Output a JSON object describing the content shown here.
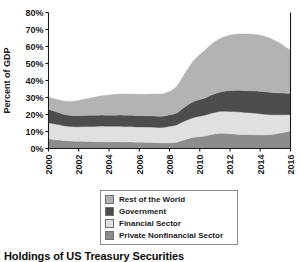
{
  "figure": {
    "title": "Holdings of US Treasury Securities"
  },
  "legend": {
    "items": [
      {
        "label": "Rest of the World",
        "color": "#b3b3b3"
      },
      {
        "label": "Government",
        "color": "#4d4d4d"
      },
      {
        "label": "Financial Sector",
        "color": "#e0e0e0"
      },
      {
        "label": "Private Nonfinancial Sector",
        "color": "#8c8c8c"
      }
    ]
  },
  "chart_data": {
    "type": "area",
    "stacked": true,
    "title": "Holdings of US Treasury Securities",
    "xlabel": "",
    "ylabel": "Percent of GDP",
    "xlim": [
      2000,
      2016
    ],
    "ylim": [
      0,
      80
    ],
    "ytick_labels": [
      "0%",
      "10%",
      "20%",
      "30%",
      "40%",
      "50%",
      "60%",
      "70%",
      "80%"
    ],
    "ytick_values": [
      0,
      10,
      20,
      30,
      40,
      50,
      60,
      70,
      80
    ],
    "xtick_labels": [
      "2000",
      "2002",
      "2004",
      "2006",
      "2008",
      "2010",
      "2012",
      "2014",
      "2016"
    ],
    "xtick_values": [
      2000,
      2002,
      2004,
      2006,
      2008,
      2010,
      2012,
      2014,
      2016
    ],
    "grid": false,
    "legend_position": "below-axes",
    "x": [
      2000.0,
      2000.25,
      2000.5,
      2000.75,
      2001.0,
      2001.25,
      2001.5,
      2001.75,
      2002.0,
      2002.25,
      2002.5,
      2002.75,
      2003.0,
      2003.25,
      2003.5,
      2003.75,
      2004.0,
      2004.25,
      2004.5,
      2004.75,
      2005.0,
      2005.25,
      2005.5,
      2005.75,
      2006.0,
      2006.25,
      2006.5,
      2006.75,
      2007.0,
      2007.25,
      2007.5,
      2007.75,
      2008.0,
      2008.25,
      2008.5,
      2008.75,
      2009.0,
      2009.25,
      2009.5,
      2009.75,
      2010.0,
      2010.25,
      2010.5,
      2010.75,
      2011.0,
      2011.25,
      2011.5,
      2011.75,
      2012.0,
      2012.25,
      2012.5,
      2012.75,
      2013.0,
      2013.25,
      2013.5,
      2013.75,
      2014.0,
      2014.25,
      2014.5,
      2014.75,
      2015.0,
      2015.25,
      2015.5,
      2015.75,
      2016.0
    ],
    "series": [
      {
        "name": "Private Nonfinancial Sector",
        "color": "#8c8c8c",
        "stack_order": 1,
        "values": [
          5.6,
          5.4,
          5.2,
          5.0,
          4.7,
          4.5,
          4.4,
          4.3,
          4.2,
          4.2,
          4.1,
          4.1,
          4.0,
          4.0,
          4.0,
          3.9,
          3.9,
          3.9,
          3.9,
          3.9,
          3.8,
          3.8,
          3.8,
          3.7,
          3.7,
          3.7,
          3.6,
          3.6,
          3.5,
          3.4,
          3.3,
          3.2,
          3.3,
          3.4,
          3.7,
          4.5,
          5.2,
          5.8,
          6.4,
          6.8,
          7.0,
          7.2,
          7.6,
          8.2,
          8.6,
          8.9,
          9.0,
          8.9,
          8.7,
          8.5,
          8.4,
          8.3,
          8.2,
          8.2,
          8.1,
          8.1,
          8.0,
          8.0,
          8.1,
          8.3,
          8.6,
          9.0,
          9.4,
          9.9,
          10.3
        ]
      },
      {
        "name": "Financial Sector",
        "color": "#e0e0e0",
        "stack_order": 2,
        "values": [
          9.5,
          9.3,
          9.1,
          8.9,
          8.7,
          8.6,
          8.5,
          8.5,
          8.6,
          8.7,
          8.8,
          8.9,
          9.0,
          9.1,
          9.2,
          9.2,
          9.2,
          9.2,
          9.2,
          9.2,
          9.1,
          9.1,
          9.1,
          9.0,
          9.0,
          9.0,
          9.0,
          9.0,
          9.0,
          9.0,
          9.1,
          9.4,
          9.8,
          10.0,
          10.2,
          10.6,
          11.0,
          11.3,
          11.5,
          11.8,
          12.0,
          12.2,
          12.4,
          12.5,
          12.6,
          12.8,
          12.9,
          13.0,
          13.1,
          13.2,
          13.2,
          13.1,
          13.0,
          12.9,
          12.8,
          12.6,
          12.4,
          12.2,
          11.9,
          11.5,
          11.2,
          10.8,
          10.4,
          10.0,
          9.6
        ]
      },
      {
        "name": "Government",
        "color": "#4d4d4d",
        "stack_order": 3,
        "values": [
          7.9,
          7.6,
          7.3,
          7.0,
          6.7,
          6.6,
          6.5,
          6.5,
          6.5,
          6.5,
          6.5,
          6.5,
          6.5,
          6.5,
          6.5,
          6.5,
          6.5,
          6.5,
          6.5,
          6.6,
          6.6,
          6.6,
          6.6,
          6.6,
          6.6,
          6.6,
          6.6,
          6.6,
          6.6,
          6.6,
          6.6,
          6.6,
          6.7,
          6.8,
          7.0,
          7.5,
          8.2,
          8.8,
          9.3,
          9.6,
          9.8,
          10.0,
          10.3,
          10.7,
          11.0,
          11.3,
          11.6,
          11.9,
          12.2,
          12.4,
          12.6,
          12.7,
          12.8,
          12.9,
          13.0,
          13.1,
          13.2,
          13.2,
          13.2,
          13.1,
          13.0,
          12.9,
          12.8,
          12.6,
          12.4
        ]
      },
      {
        "name": "Rest of the World",
        "color": "#b3b3b3",
        "stack_order": 4,
        "values": [
          7.0,
          7.2,
          7.4,
          7.6,
          7.8,
          8.0,
          8.3,
          8.6,
          9.0,
          9.4,
          9.8,
          10.2,
          10.6,
          11.0,
          11.3,
          11.6,
          11.9,
          12.1,
          12.3,
          12.4,
          12.5,
          12.5,
          12.6,
          12.6,
          12.6,
          12.6,
          12.7,
          12.8,
          12.9,
          13.0,
          13.1,
          13.4,
          13.8,
          14.5,
          15.8,
          17.5,
          19.5,
          21.5,
          23.4,
          25.0,
          26.4,
          27.6,
          28.8,
          29.8,
          30.6,
          31.2,
          31.8,
          32.3,
          32.7,
          33.0,
          33.2,
          33.3,
          33.4,
          33.4,
          33.3,
          33.2,
          33.0,
          32.7,
          32.2,
          31.5,
          30.6,
          29.5,
          28.2,
          26.8,
          25.4
        ]
      }
    ]
  }
}
